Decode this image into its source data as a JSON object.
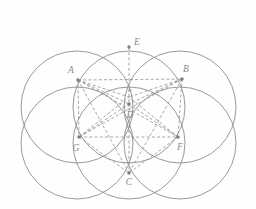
{
  "figure": {
    "background_color": "#fefefe",
    "stroke_color": "#8d8d8d",
    "dashed_stroke_color": "#909090",
    "label_color": "#8a8a8a",
    "point_color": "#7d7d7d",
    "width": 256,
    "height": 209
  },
  "circles": [
    {
      "name": "circle-top-left",
      "cx": 77,
      "cy": 107,
      "r": 56
    },
    {
      "name": "circle-top-right",
      "cx": 180,
      "cy": 107,
      "r": 56
    },
    {
      "name": "circle-bottom-left",
      "cx": 77,
      "cy": 143,
      "r": 56
    },
    {
      "name": "circle-bottom-right",
      "cx": 180,
      "cy": 143,
      "r": 56
    },
    {
      "name": "circle-upper",
      "cx": 129,
      "cy": 107,
      "r": 56
    },
    {
      "name": "circle-lower",
      "cx": 129,
      "cy": 143,
      "r": 56
    }
  ],
  "points": [
    {
      "id": "A",
      "label": "A",
      "x": 78,
      "y": 80,
      "lx": 71,
      "ly": 73
    },
    {
      "id": "B",
      "label": "B",
      "x": 182,
      "y": 79,
      "lx": 186,
      "ly": 72
    },
    {
      "id": "C",
      "label": "C",
      "x": 129,
      "y": 173,
      "lx": 129,
      "ly": 185
    },
    {
      "id": "D",
      "label": "D",
      "x": 129,
      "y": 104,
      "lx": 130,
      "ly": 118
    },
    {
      "id": "E",
      "label": "E",
      "x": 129,
      "y": 47,
      "lx": 137,
      "ly": 45
    },
    {
      "id": "F",
      "label": "F",
      "x": 178,
      "y": 137,
      "lx": 180,
      "ly": 150
    },
    {
      "id": "G",
      "label": "G",
      "x": 79,
      "y": 137,
      "lx": 76,
      "ly": 151
    },
    {
      "id": "O",
      "label": "o",
      "x": 129,
      "y": 97,
      "lx": 130,
      "ly": 92
    }
  ],
  "solid_segments": [],
  "dashed_segments": [
    {
      "name": "segment-A-B",
      "from": "A",
      "to": "B"
    },
    {
      "name": "segment-A-O",
      "from": "A",
      "to": "O"
    },
    {
      "name": "segment-B-O",
      "from": "B",
      "to": "O"
    },
    {
      "name": "segment-A-D",
      "from": "A",
      "to": "D"
    },
    {
      "name": "segment-B-D",
      "from": "B",
      "to": "D"
    },
    {
      "name": "segment-A-F",
      "from": "A",
      "to": "F"
    },
    {
      "name": "segment-B-G",
      "from": "B",
      "to": "G"
    },
    {
      "name": "segment-A-G",
      "from": "A",
      "to": "G"
    },
    {
      "name": "segment-B-F",
      "from": "B",
      "to": "F"
    },
    {
      "name": "segment-A-C",
      "from": "A",
      "to": "C"
    },
    {
      "name": "segment-B-C",
      "from": "B",
      "to": "C"
    },
    {
      "name": "segment-G-F",
      "from": "G",
      "to": "F"
    },
    {
      "name": "segment-G-C",
      "from": "G",
      "to": "C"
    },
    {
      "name": "segment-F-C",
      "from": "F",
      "to": "C"
    },
    {
      "name": "segment-G-D",
      "from": "G",
      "to": "D"
    },
    {
      "name": "segment-F-D",
      "from": "F",
      "to": "D"
    },
    {
      "name": "segment-G-O",
      "from": "G",
      "to": "O"
    },
    {
      "name": "segment-F-O",
      "from": "F",
      "to": "O"
    },
    {
      "name": "segment-E-D",
      "from": "E",
      "to": "D"
    },
    {
      "name": "segment-D-C",
      "from": "D",
      "to": "C"
    }
  ]
}
